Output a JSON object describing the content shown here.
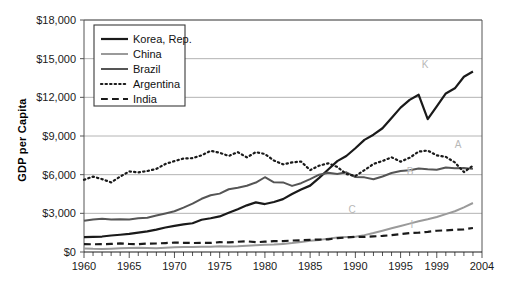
{
  "chart_data": {
    "type": "line",
    "title": "",
    "xlabel": "",
    "ylabel": "GDP per Capita",
    "xlim": [
      1960,
      2004
    ],
    "ylim": [
      0,
      18000
    ],
    "grid": true,
    "legend_position": "top-left",
    "y_ticks": [
      "$0",
      "$3,000",
      "$6,000",
      "$9,000",
      "$12,000",
      "$15,000",
      "$18,000"
    ],
    "y_tick_values": [
      0,
      3000,
      6000,
      9000,
      12000,
      15000,
      18000
    ],
    "x_ticks": [
      "1960",
      "1965",
      "1970",
      "1975",
      "1980",
      "1985",
      "1990",
      "1995",
      "1999",
      "2004"
    ],
    "x_tick_values": [
      1960,
      1965,
      1970,
      1975,
      1980,
      1985,
      1990,
      1995,
      1999,
      2004
    ],
    "x": [
      1960,
      1961,
      1962,
      1963,
      1964,
      1965,
      1966,
      1967,
      1968,
      1969,
      1970,
      1971,
      1972,
      1973,
      1974,
      1975,
      1976,
      1977,
      1978,
      1979,
      1980,
      1981,
      1982,
      1983,
      1984,
      1985,
      1986,
      1987,
      1988,
      1989,
      1990,
      1991,
      1992,
      1993,
      1994,
      1995,
      1996,
      1997,
      1998,
      1999,
      2000,
      2001,
      2002,
      2003
    ],
    "series": [
      {
        "name": "Korea, Rep.",
        "color": "#1a1a1a",
        "style": "solid",
        "width": 2.2,
        "annotation": "K",
        "values": [
          1150,
          1180,
          1200,
          1280,
          1340,
          1400,
          1510,
          1600,
          1740,
          1900,
          2030,
          2140,
          2230,
          2500,
          2620,
          2760,
          3050,
          3320,
          3620,
          3850,
          3720,
          3880,
          4100,
          4500,
          4850,
          5150,
          5750,
          6400,
          7050,
          7450,
          8050,
          8700,
          9100,
          9600,
          10400,
          11200,
          11800,
          12200,
          10300,
          11300,
          12300,
          12700,
          13600,
          14000
        ]
      },
      {
        "name": "China",
        "color": "#9a9a9a",
        "style": "solid",
        "width": 2.0,
        "annotation": "C",
        "values": [
          280,
          250,
          240,
          255,
          285,
          310,
          330,
          310,
          300,
          330,
          370,
          385,
          390,
          415,
          415,
          440,
          430,
          445,
          490,
          525,
          560,
          585,
          630,
          690,
          780,
          880,
          940,
          1030,
          1130,
          1160,
          1190,
          1310,
          1470,
          1650,
          1840,
          2020,
          2200,
          2380,
          2540,
          2720,
          2940,
          3160,
          3460,
          3800
        ]
      },
      {
        "name": "Brazil",
        "color": "#555555",
        "style": "solid",
        "width": 2.0,
        "annotation": "B",
        "values": [
          2420,
          2530,
          2580,
          2530,
          2550,
          2530,
          2620,
          2660,
          2830,
          2990,
          3160,
          3440,
          3750,
          4130,
          4400,
          4530,
          4870,
          4990,
          5140,
          5390,
          5800,
          5410,
          5400,
          5130,
          5340,
          5650,
          6000,
          6150,
          6050,
          6180,
          5820,
          5790,
          5640,
          5860,
          6130,
          6290,
          6350,
          6480,
          6420,
          6380,
          6550,
          6500,
          6520,
          6450
        ]
      },
      {
        "name": "Argentina",
        "color": "#1a1a1a",
        "style": "dotted",
        "width": 2.2,
        "annotation": "A",
        "values": [
          5600,
          5850,
          5650,
          5400,
          5850,
          6250,
          6180,
          6280,
          6450,
          6830,
          7050,
          7250,
          7280,
          7500,
          7850,
          7700,
          7450,
          7750,
          7340,
          7750,
          7600,
          7100,
          6800,
          6950,
          7020,
          6350,
          6700,
          6880,
          6600,
          6050,
          5900,
          6350,
          6830,
          7060,
          7350,
          7010,
          7310,
          7790,
          7870,
          7500,
          7380,
          6950,
          6200,
          6700
        ]
      },
      {
        "name": "India",
        "color": "#1a1a1a",
        "style": "dashed",
        "width": 2.2,
        "annotation": "I",
        "values": [
          610,
          600,
          610,
          630,
          665,
          620,
          610,
          650,
          660,
          695,
          725,
          715,
          695,
          715,
          705,
          760,
          745,
          795,
          830,
          760,
          800,
          840,
          850,
          890,
          910,
          940,
          965,
          985,
          1070,
          1120,
          1180,
          1170,
          1210,
          1250,
          1310,
          1390,
          1470,
          1500,
          1560,
          1650,
          1680,
          1730,
          1760,
          1860
        ]
      }
    ]
  },
  "legend": {
    "items": [
      {
        "label": "Korea, Rep."
      },
      {
        "label": "China"
      },
      {
        "label": "Brazil"
      },
      {
        "label": "Argentina"
      },
      {
        "label": "India"
      }
    ]
  },
  "colors": {
    "korea": "#1a1a1a",
    "china": "#9a9a9a",
    "brazil": "#555555",
    "argentina": "#1a1a1a",
    "india": "#1a1a1a",
    "grid": "#b4b4b4",
    "axis": "#555555",
    "background": "#ffffff"
  }
}
